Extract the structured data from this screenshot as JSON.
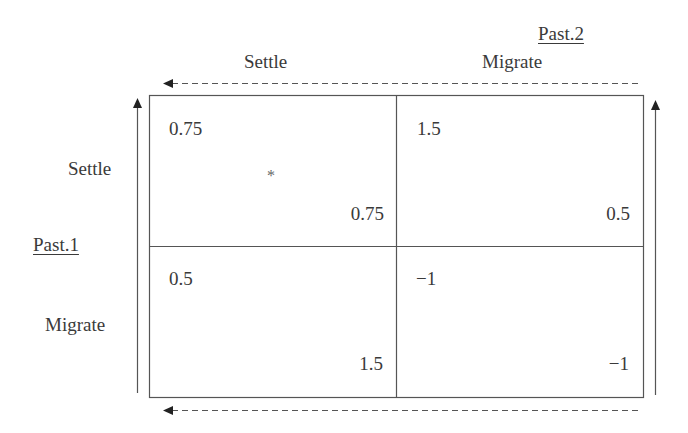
{
  "players": {
    "column_player": {
      "name": "Past.2",
      "strategies": [
        "Settle",
        "Migrate"
      ]
    },
    "row_player": {
      "name": "Past.1",
      "strategies": [
        "Settle",
        "Migrate"
      ]
    }
  },
  "payoff_matrix": {
    "cells": [
      {
        "row": "Settle",
        "col": "Settle",
        "row_payoff": "0.75",
        "col_payoff": "0.75",
        "marker": "*"
      },
      {
        "row": "Settle",
        "col": "Migrate",
        "row_payoff": "1.5",
        "col_payoff": "0.5",
        "marker": ""
      },
      {
        "row": "Migrate",
        "col": "Settle",
        "row_payoff": "0.5",
        "col_payoff": "1.5",
        "marker": ""
      },
      {
        "row": "Migrate",
        "col": "Migrate",
        "row_payoff": "−1",
        "col_payoff": "−1",
        "marker": ""
      }
    ]
  },
  "arrows": {
    "top": {
      "style": "dashed",
      "direction": "left"
    },
    "bottom": {
      "style": "dashed",
      "direction": "left"
    },
    "left": {
      "style": "solid",
      "direction": "up"
    },
    "right": {
      "style": "solid",
      "direction": "up"
    }
  },
  "colors": {
    "ink": "#3a3a3a",
    "line": "#555555",
    "background": "#ffffff"
  }
}
